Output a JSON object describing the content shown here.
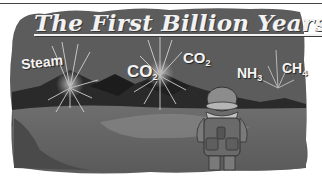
{
  "illustration": {
    "title": "The First Billion Years",
    "gas_labels": [
      {
        "name": "Steam",
        "formula_main": "Steam",
        "subscript": ""
      },
      {
        "name": "Carbon dioxide",
        "formula_main": "CO",
        "subscript": "2"
      },
      {
        "name": "Carbon dioxide",
        "formula_main": "CO",
        "subscript": "2"
      },
      {
        "name": "Ammonia",
        "formula_main": "NH",
        "subscript": "3"
      },
      {
        "name": "Methane",
        "formula_main": "CH",
        "subscript": "4"
      }
    ],
    "character": "explorer-with-backpack",
    "colors": {
      "sky": "#5e5e5e",
      "mountains_dark": "#262626",
      "ground": "#6b6b6b",
      "path_light": "#8a8a8a",
      "text": "#f2f2f2"
    }
  }
}
